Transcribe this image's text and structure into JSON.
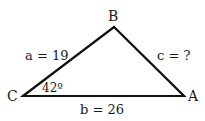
{
  "diagram": {
    "type": "triangle",
    "vertices": {
      "A": {
        "label": "A",
        "x": 184,
        "y": 96
      },
      "B": {
        "label": "B",
        "x": 114,
        "y": 27
      },
      "C": {
        "label": "C",
        "x": 23,
        "y": 96
      }
    },
    "sides": {
      "a": {
        "label": "a = 19",
        "between": [
          "C",
          "B"
        ]
      },
      "b": {
        "label": "b = 26",
        "between": [
          "C",
          "A"
        ]
      },
      "c": {
        "label": "c = ?",
        "between": [
          "B",
          "A"
        ]
      }
    },
    "angles": {
      "C": {
        "label": "42º"
      }
    },
    "stroke_color": "#111111"
  }
}
